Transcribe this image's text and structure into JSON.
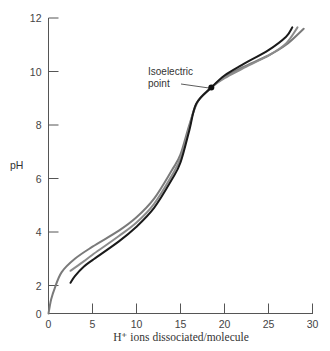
{
  "chart_data": {
    "type": "line",
    "title": "",
    "xlabel": "H⁺ ions dissociated/molecule",
    "ylabel": "pH",
    "xlim": [
      0,
      30
    ],
    "ylim": [
      0,
      12
    ],
    "x_ticks": [
      0,
      5,
      10,
      15,
      20,
      25,
      30
    ],
    "y_ticks": [
      0,
      2,
      4,
      6,
      8,
      10,
      12
    ],
    "grid": false,
    "legend": null,
    "series": [
      {
        "name": "curve-outer-gray",
        "color": "#7a7a7a",
        "points": [
          [
            0,
            0
          ],
          [
            0.3,
            1.0
          ],
          [
            0.7,
            1.8
          ],
          [
            1.5,
            2.5
          ],
          [
            3,
            3.0
          ],
          [
            5,
            3.45
          ],
          [
            8,
            4.05
          ],
          [
            10,
            4.55
          ],
          [
            12,
            5.25
          ],
          [
            14,
            6.3
          ],
          [
            15,
            6.9
          ],
          [
            16,
            8.0
          ],
          [
            17,
            8.9
          ],
          [
            18.5,
            9.4
          ],
          [
            20,
            9.8
          ],
          [
            22,
            10.15
          ],
          [
            25,
            10.6
          ],
          [
            27,
            11.0
          ],
          [
            29,
            11.6
          ]
        ]
      },
      {
        "name": "curve-middle-gray",
        "color": "#8c8c8c",
        "points": [
          [
            2.5,
            2.55
          ],
          [
            4,
            2.9
          ],
          [
            5,
            3.15
          ],
          [
            8,
            3.85
          ],
          [
            10,
            4.35
          ],
          [
            12,
            5.05
          ],
          [
            14,
            6.1
          ],
          [
            15,
            6.75
          ],
          [
            16,
            7.9
          ],
          [
            16.8,
            8.8
          ],
          [
            18.5,
            9.4
          ],
          [
            20,
            9.75
          ],
          [
            22,
            10.1
          ],
          [
            25,
            10.6
          ],
          [
            27,
            11.05
          ],
          [
            28.3,
            11.65
          ]
        ]
      },
      {
        "name": "curve-black",
        "color": "#1a1a1a",
        "points": [
          [
            2.5,
            2.1
          ],
          [
            3,
            2.35
          ],
          [
            4,
            2.7
          ],
          [
            5,
            2.95
          ],
          [
            8,
            3.65
          ],
          [
            10,
            4.2
          ],
          [
            12,
            4.9
          ],
          [
            14,
            5.95
          ],
          [
            15,
            6.6
          ],
          [
            16,
            7.8
          ],
          [
            16.8,
            8.8
          ],
          [
            18.5,
            9.4
          ],
          [
            20,
            9.85
          ],
          [
            22,
            10.25
          ],
          [
            25,
            10.8
          ],
          [
            27,
            11.3
          ],
          [
            27.7,
            11.65
          ]
        ]
      }
    ],
    "annotations": [
      {
        "text_line1": "Isoelectric",
        "text_line2": "point",
        "x": 18.5,
        "y": 9.4,
        "marker": "filled-circle"
      }
    ]
  },
  "labels": {
    "ylabel": "pH",
    "xlabel": "H⁺ ions dissociated/molecule",
    "annotation_line1": "Isoelectric",
    "annotation_line2": "point",
    "y_ticks": [
      "0",
      "2",
      "4",
      "6",
      "8",
      "10",
      "12"
    ],
    "x_ticks": [
      "0",
      "5",
      "10",
      "15",
      "20",
      "25",
      "30"
    ]
  }
}
